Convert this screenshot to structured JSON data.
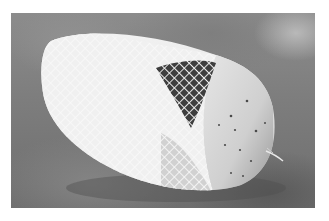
{
  "image": {
    "subject": "netted cylindrical cheese roll on gray surface",
    "alt": "A cylindrical roll wrapped in white elastic netting, partially unwrapped at one end, on a mottled gray background",
    "colors": {
      "border": "#ffffff",
      "background": "#7d7d7d",
      "background_light": "#bebebe",
      "net": "#f4f4f4",
      "object_body": "#dcdcdc",
      "object_shadow": "#505050",
      "spots": "#4a4a4a"
    }
  }
}
